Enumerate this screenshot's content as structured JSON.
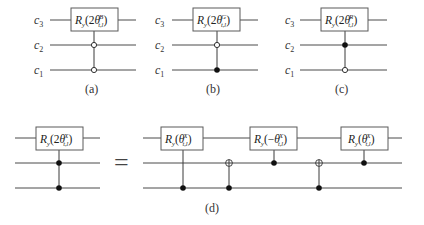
{
  "figure": {
    "panels": {
      "a": {
        "caption": "(a)",
        "wire_labels": [
          {
            "base": "c",
            "sub": "3"
          },
          {
            "base": "c",
            "sub": "2"
          },
          {
            "base": "c",
            "sub": "1"
          }
        ],
        "gate": {
          "name": "R",
          "name_sub": "y",
          "arg_prefix": "(2",
          "theta": "θ",
          "sup": "B",
          "sub": "t,l",
          "arg_suffix": ")"
        },
        "controls": {
          "c2": "open",
          "c1": "open"
        }
      },
      "b": {
        "caption": "(b)",
        "wire_labels": [
          {
            "base": "c",
            "sub": "3"
          },
          {
            "base": "c",
            "sub": "2"
          },
          {
            "base": "c",
            "sub": "1"
          }
        ],
        "gate": {
          "name": "R",
          "name_sub": "y",
          "arg_prefix": "(2",
          "theta": "θ",
          "sup": "G",
          "sub": "t,l",
          "arg_suffix": ")"
        },
        "controls": {
          "c2": "open",
          "c1": "filled"
        }
      },
      "c": {
        "caption": "(c)",
        "wire_labels": [
          {
            "base": "c",
            "sub": "3"
          },
          {
            "base": "c",
            "sub": "2"
          },
          {
            "base": "c",
            "sub": "1"
          }
        ],
        "gate": {
          "name": "R",
          "name_sub": "y",
          "arg_prefix": "(2",
          "theta": "θ",
          "sup": "R",
          "sub": "t,l",
          "arg_suffix": ")"
        },
        "controls": {
          "c2": "filled",
          "c1": "open"
        }
      },
      "d": {
        "caption": "(d)",
        "equals": "=",
        "lhs_gate": {
          "name": "R",
          "name_sub": "y",
          "arg_prefix": "(2",
          "theta": "θ",
          "sup": "X",
          "sub": "t,l",
          "arg_suffix": ")"
        },
        "rhs_gates": [
          {
            "name": "R",
            "name_sub": "y",
            "arg_prefix": "(",
            "theta": "θ",
            "sup": "X",
            "sub": "t,l",
            "arg_suffix": ")"
          },
          {
            "name": "R",
            "name_sub": "y",
            "arg_prefix": "(−",
            "theta": "θ",
            "sup": "X",
            "sub": "t,l",
            "arg_suffix": ")"
          },
          {
            "name": "R",
            "name_sub": "y",
            "arg_prefix": "(",
            "theta": "θ",
            "sup": "X",
            "sub": "t,l",
            "arg_suffix": ")"
          }
        ],
        "rhs_sequence": [
          "controlled-Ry(c1)",
          "CNOT(c1→c2)",
          "controlled-Ry(c2)",
          "CNOT(c1→c2)",
          "controlled-Ry(c2)"
        ]
      }
    }
  }
}
